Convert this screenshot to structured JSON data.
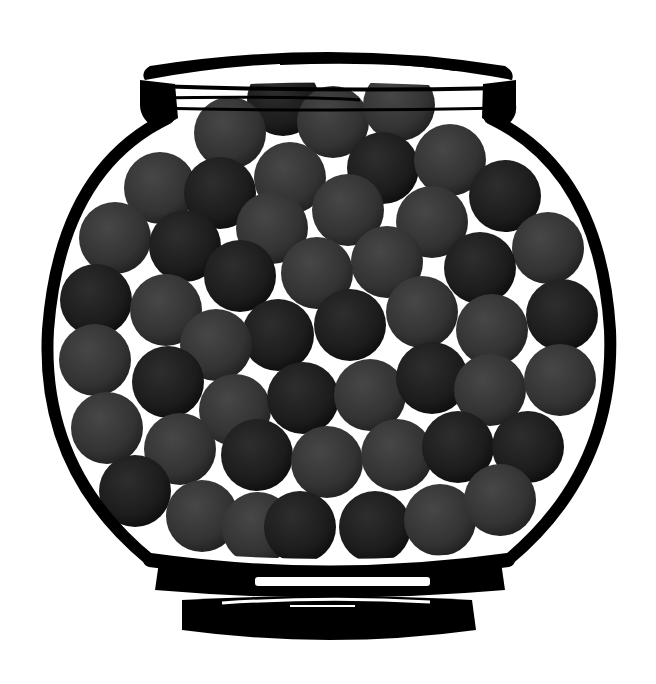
{
  "scene": {
    "subject": "jar filled with dark gray balls",
    "background": "#ffffff",
    "outline_color": "#000000",
    "ball_colors": {
      "light": "#4a4a4a",
      "mid": "#383838",
      "dark": "#1e1e1e"
    },
    "ball_radius": 36,
    "balls": [
      {
        "x": 283,
        "y": 100,
        "t": "dark"
      },
      {
        "x": 333,
        "y": 122,
        "t": "mid"
      },
      {
        "x": 399,
        "y": 105,
        "t": "mid"
      },
      {
        "x": 230,
        "y": 133,
        "t": "mid"
      },
      {
        "x": 383,
        "y": 168,
        "t": "dark"
      },
      {
        "x": 450,
        "y": 160,
        "t": "mid"
      },
      {
        "x": 160,
        "y": 188,
        "t": "mid"
      },
      {
        "x": 220,
        "y": 193,
        "t": "dark"
      },
      {
        "x": 290,
        "y": 178,
        "t": "mid"
      },
      {
        "x": 348,
        "y": 210,
        "t": "mid"
      },
      {
        "x": 505,
        "y": 196,
        "t": "dark"
      },
      {
        "x": 432,
        "y": 222,
        "t": "mid"
      },
      {
        "x": 115,
        "y": 238,
        "t": "mid"
      },
      {
        "x": 185,
        "y": 246,
        "t": "dark"
      },
      {
        "x": 272,
        "y": 228,
        "t": "mid"
      },
      {
        "x": 548,
        "y": 248,
        "t": "mid"
      },
      {
        "x": 387,
        "y": 262,
        "t": "mid"
      },
      {
        "x": 480,
        "y": 268,
        "t": "dark"
      },
      {
        "x": 96,
        "y": 300,
        "t": "dark"
      },
      {
        "x": 166,
        "y": 310,
        "t": "mid"
      },
      {
        "x": 240,
        "y": 276,
        "t": "dark"
      },
      {
        "x": 317,
        "y": 273,
        "t": "mid"
      },
      {
        "x": 562,
        "y": 315,
        "t": "dark"
      },
      {
        "x": 422,
        "y": 312,
        "t": "mid"
      },
      {
        "x": 492,
        "y": 330,
        "t": "mid"
      },
      {
        "x": 350,
        "y": 325,
        "t": "dark"
      },
      {
        "x": 278,
        "y": 335,
        "t": "dark"
      },
      {
        "x": 95,
        "y": 360,
        "t": "mid"
      },
      {
        "x": 216,
        "y": 345,
        "t": "mid"
      },
      {
        "x": 168,
        "y": 382,
        "t": "dark"
      },
      {
        "x": 235,
        "y": 410,
        "t": "mid"
      },
      {
        "x": 303,
        "y": 398,
        "t": "dark"
      },
      {
        "x": 370,
        "y": 395,
        "t": "mid"
      },
      {
        "x": 432,
        "y": 378,
        "t": "dark"
      },
      {
        "x": 490,
        "y": 390,
        "t": "mid"
      },
      {
        "x": 560,
        "y": 380,
        "t": "mid"
      },
      {
        "x": 107,
        "y": 428,
        "t": "mid"
      },
      {
        "x": 180,
        "y": 449,
        "t": "mid"
      },
      {
        "x": 257,
        "y": 455,
        "t": "dark"
      },
      {
        "x": 327,
        "y": 462,
        "t": "mid"
      },
      {
        "x": 397,
        "y": 455,
        "t": "mid"
      },
      {
        "x": 458,
        "y": 447,
        "t": "dark"
      },
      {
        "x": 528,
        "y": 447,
        "t": "dark"
      },
      {
        "x": 135,
        "y": 491,
        "t": "dark"
      },
      {
        "x": 202,
        "y": 516,
        "t": "mid"
      },
      {
        "x": 258,
        "y^": 0,
        "y": 528,
        "t": "mid"
      },
      {
        "x": 300,
        "y": 527,
        "t": "dark"
      },
      {
        "x": 375,
        "y": 527,
        "t": "dark"
      },
      {
        "x": 440,
        "y": 520,
        "t": "mid"
      },
      {
        "x": 500,
        "y": 500,
        "t": "mid"
      }
    ]
  }
}
